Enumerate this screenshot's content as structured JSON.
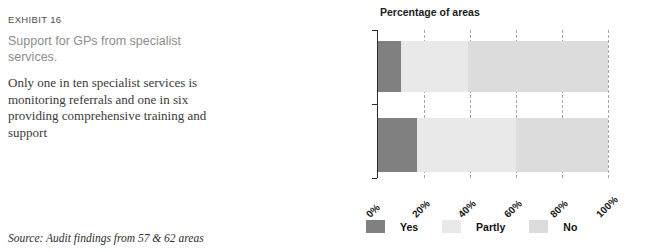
{
  "exhibit": {
    "label": "EXHIBIT 16",
    "title": "Support for GPs from specialist services.",
    "summary": "Only one in ten specialist services is monitoring referrals and one in six providing comprehensive training and support",
    "source": "Source: Audit findings from 57 & 62 areas"
  },
  "colors": {
    "yes": "#808080",
    "partly": "#e9e9e9",
    "no": "#dcdcdc",
    "axis": "#2b2b2b",
    "grid": "#a8a8a8"
  },
  "chart_data": {
    "type": "bar",
    "orientation": "horizontal",
    "stacked": true,
    "title": "Percentage of areas",
    "xlabel": "",
    "ylabel": "",
    "xlim": [
      0,
      100
    ],
    "grid": true,
    "legend_position": "bottom",
    "categories": [
      "Consistent monitoring\nand follow-up",
      "Comprehensive training\nand support"
    ],
    "tick_labels": [
      "0%",
      "20%",
      "40%",
      "60%",
      "80%",
      "100%"
    ],
    "tick_values": [
      0,
      20,
      40,
      60,
      80,
      100
    ],
    "series": [
      {
        "name": "Yes",
        "values": [
          10,
          17
        ]
      },
      {
        "name": "Partly",
        "values": [
          29,
          43
        ]
      },
      {
        "name": "No",
        "values": [
          61,
          40
        ]
      }
    ]
  },
  "legend": [
    {
      "label": "Yes",
      "color": "#808080"
    },
    {
      "label": "Partly",
      "color": "#e9e9e9"
    },
    {
      "label": "No",
      "color": "#dcdcdc"
    }
  ]
}
